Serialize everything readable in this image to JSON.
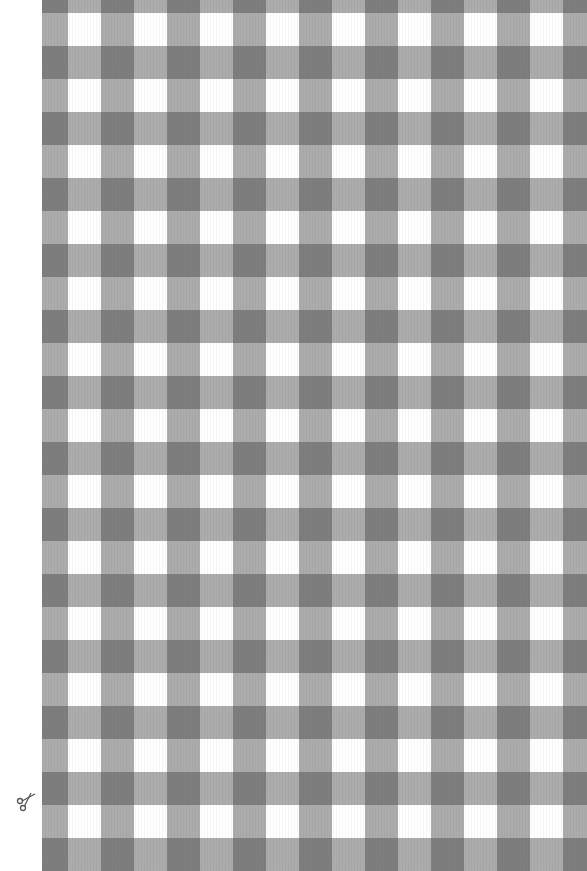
{
  "pattern": {
    "type": "gingham-check",
    "colors": {
      "dark": "#6b6b6b",
      "mid": "#a8a8a8",
      "light": "#ffffff",
      "margin": "#ffffff"
    },
    "period_px": 66
  },
  "icons": {
    "cut_mark": "scissors-icon"
  }
}
